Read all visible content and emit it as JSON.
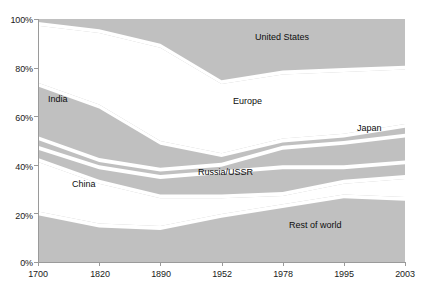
{
  "chart_data": {
    "type": "area",
    "stacked": true,
    "title": "",
    "subtitle": "",
    "xlabel": "",
    "ylabel": "",
    "grid": false,
    "legend_position": "inline-annotations",
    "x": [
      "1700",
      "1820",
      "1890",
      "1952",
      "1978",
      "1995",
      "2003"
    ],
    "xtick_labels": [
      "1700",
      "1820",
      "1890",
      "1952",
      "1978",
      "1995",
      "2003"
    ],
    "ytick_labels": [
      "0%",
      "20%",
      "40%",
      "60%",
      "80%",
      "100%"
    ],
    "ytick_values": [
      0,
      20,
      40,
      60,
      80,
      100
    ],
    "ylim": [
      0,
      100
    ],
    "y_unit": "%",
    "series": [
      {
        "name": "Rest of world",
        "values": [
          20,
          15,
          14,
          19,
          23,
          27,
          26
        ]
      },
      {
        "name": "China",
        "values": [
          22,
          18,
          13,
          8,
          5,
          6,
          9
        ]
      },
      {
        "name": "Russia/USSR",
        "values": [
          5,
          6,
          8,
          10,
          11,
          6,
          6
        ]
      },
      {
        "name": "Japan",
        "values": [
          4,
          3,
          3,
          3,
          8,
          10,
          11
        ]
      },
      {
        "name": "India",
        "values": [
          22,
          22,
          11,
          4,
          3,
          3,
          4
        ]
      },
      {
        "name": "Europe",
        "values": [
          25,
          31,
          40,
          30,
          28,
          27,
          24
        ]
      },
      {
        "name": "United States",
        "values": [
          2,
          5,
          11,
          26,
          22,
          21,
          20
        ]
      }
    ],
    "annotations": [
      {
        "text": "United States",
        "x_pct": 68.5,
        "y_pct": 88.0
      },
      {
        "text": "Europe",
        "x_pct": 62.0,
        "y_pct": 64.5
      },
      {
        "text": "Japan",
        "x_pct": 89.0,
        "y_pct": 55.5
      },
      {
        "text": "India",
        "x_pct": 17.0,
        "y_pct": 56.5
      },
      {
        "text": "Russia/USSR",
        "x_pct": 50.5,
        "y_pct": 41.5
      },
      {
        "text": "China",
        "x_pct": 24.0,
        "y_pct": 30.5
      },
      {
        "text": "Rest of world",
        "x_pct": 70.0,
        "y_pct": 14.5
      }
    ],
    "colors": {
      "band_fill": "#c0c0c0",
      "band_gap": "#ffffff",
      "axis": "#9a9a9a",
      "text": "#111111",
      "background": "#ffffff"
    }
  },
  "axis": {
    "y_ticks": [
      "100%",
      "80%",
      "60%",
      "40%",
      "20%",
      "0%"
    ],
    "x_ticks": [
      "1700",
      "1820",
      "1890",
      "1952",
      "1978",
      "1995",
      "2003"
    ]
  },
  "labels": {
    "united_states": "United States",
    "europe": "Europe",
    "japan": "Japan",
    "india": "India",
    "russia_ussr": "Russia/USSR",
    "china": "China",
    "rest_of_world": "Rest of world"
  }
}
